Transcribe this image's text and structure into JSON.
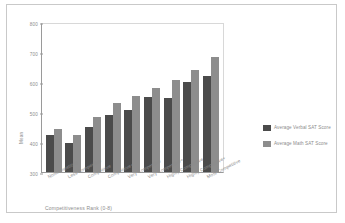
{
  "chart_data": {
    "type": "bar",
    "title": "",
    "xlabel": "Competitiveness Rank (0-8)",
    "ylabel": "Mean",
    "ylim": [
      300,
      800
    ],
    "yticks": [
      300,
      400,
      500,
      600,
      700,
      800
    ],
    "grid": false,
    "legend_position": "right",
    "categories": [
      "Noncompetitive",
      "Less Competitive",
      "Competitive",
      "Competitive+",
      "Very Competitive",
      "Very Competitive+",
      "Highly Competitive",
      "Highly Competitive+",
      "Most Competitive"
    ],
    "series": [
      {
        "name": "Average Verbal SAT Score",
        "color": "#4b4b4b",
        "values": [
          424,
          398,
          451,
          489,
          506,
          549,
          548,
          601,
          621
        ]
      },
      {
        "name": "Average Math SAT Score",
        "color": "#8d8d8d",
        "values": [
          444,
          423,
          484,
          529,
          552,
          580,
          608,
          639,
          685
        ]
      }
    ]
  },
  "axes": {
    "y_title": "Mean",
    "x_title": "Competitiveness Rank (0-8)",
    "y_tick_labels": [
      "800",
      "700",
      "600",
      "500",
      "400",
      "300"
    ]
  },
  "legend": {
    "entries": [
      {
        "label": "Average Verbal SAT Score",
        "color": "#4b4b4b"
      },
      {
        "label": "Average Math SAT Score",
        "color": "#8d8d8d"
      }
    ]
  }
}
